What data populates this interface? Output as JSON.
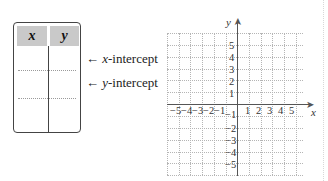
{
  "table": {
    "headers": [
      "x",
      "y"
    ],
    "header_bg": "#c9c9c9",
    "rows": [
      [
        "",
        ""
      ],
      [
        "",
        ""
      ],
      [
        "",
        ""
      ]
    ]
  },
  "annotations": [
    {
      "arrow": "←",
      "var": "x",
      "text": "-intercept"
    },
    {
      "arrow": "←",
      "var": "y",
      "text": "-intercept"
    }
  ],
  "graph": {
    "x_label": "x",
    "y_label": "y",
    "x_ticks_neg": [
      "−5",
      "−4",
      "−3",
      "−2",
      "−1"
    ],
    "x_ticks_pos": [
      "1",
      "2",
      "3",
      "4",
      "5"
    ],
    "y_ticks_pos": [
      "5",
      "4",
      "3",
      "2",
      "1"
    ],
    "y_ticks_neg": [
      "−1",
      "−2",
      "−3",
      "−4",
      "−5"
    ],
    "range": {
      "x": [
        -6,
        6
      ],
      "y": [
        -6,
        6
      ]
    }
  }
}
